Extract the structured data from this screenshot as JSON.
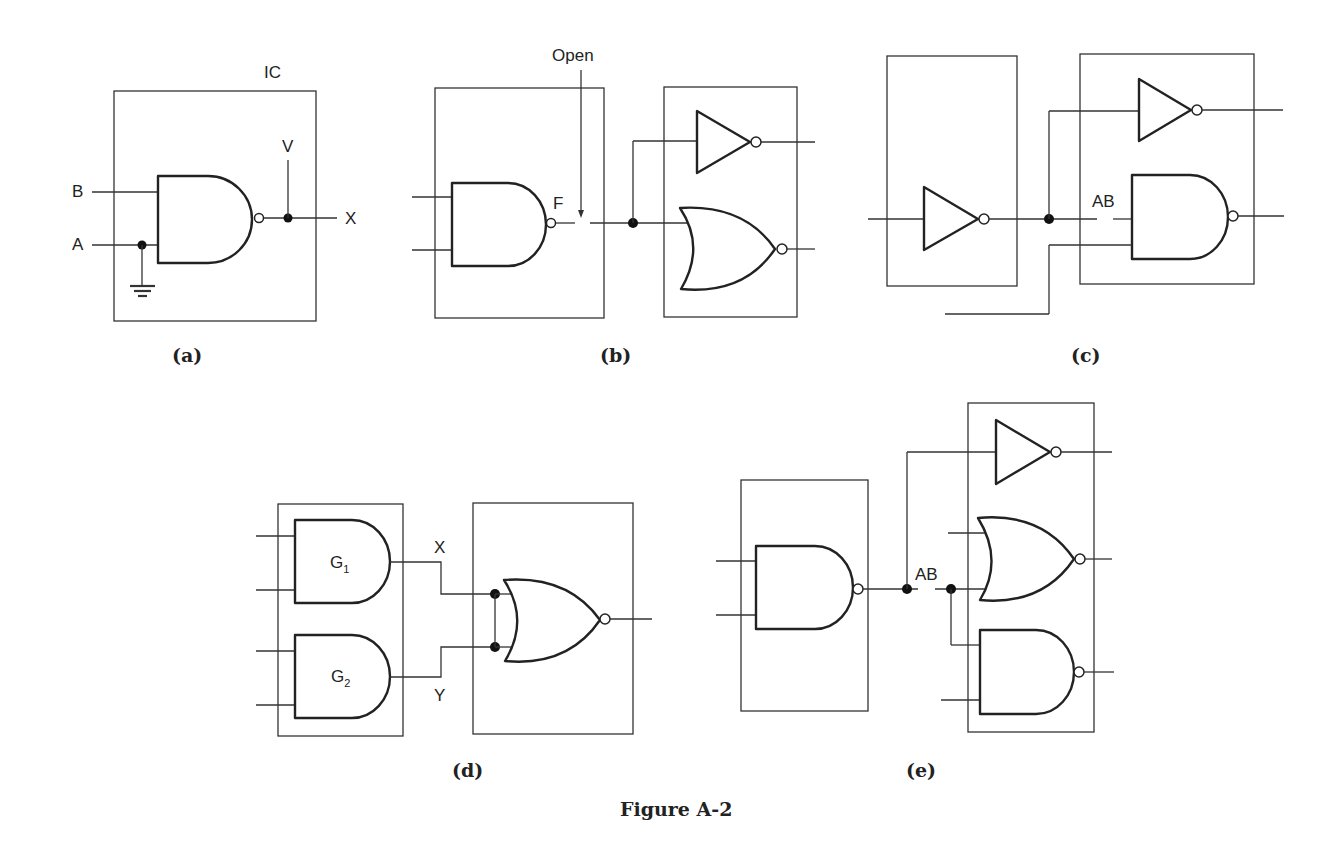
{
  "figure": {
    "caption": "Figure A-2",
    "panels": {
      "a": {
        "label": "(a)",
        "ic_label": "IC",
        "inputs": [
          "B",
          "A"
        ],
        "supply_label": "V",
        "output_label": "X",
        "gates": [
          "NAND"
        ],
        "notes": "Input A tied to ground; output X tied to V"
      },
      "b": {
        "label": "(b)",
        "open_label": "Open",
        "node_label": "F",
        "gates": [
          "NAND",
          "INVERTER",
          "NOR"
        ]
      },
      "c": {
        "label": "(c)",
        "node_label": "AB",
        "gates": [
          "INVERTER",
          "INVERTER",
          "NAND"
        ]
      },
      "d": {
        "label": "(d)",
        "gate1_label": "G",
        "gate1_sub": "1",
        "gate2_label": "G",
        "gate2_sub": "2",
        "out1_label": "X",
        "out2_label": "Y",
        "gates": [
          "AND",
          "AND",
          "NOR"
        ]
      },
      "e": {
        "label": "(e)",
        "node_label": "AB",
        "gates": [
          "NAND",
          "INVERTER",
          "NOR",
          "NAND"
        ]
      }
    }
  }
}
